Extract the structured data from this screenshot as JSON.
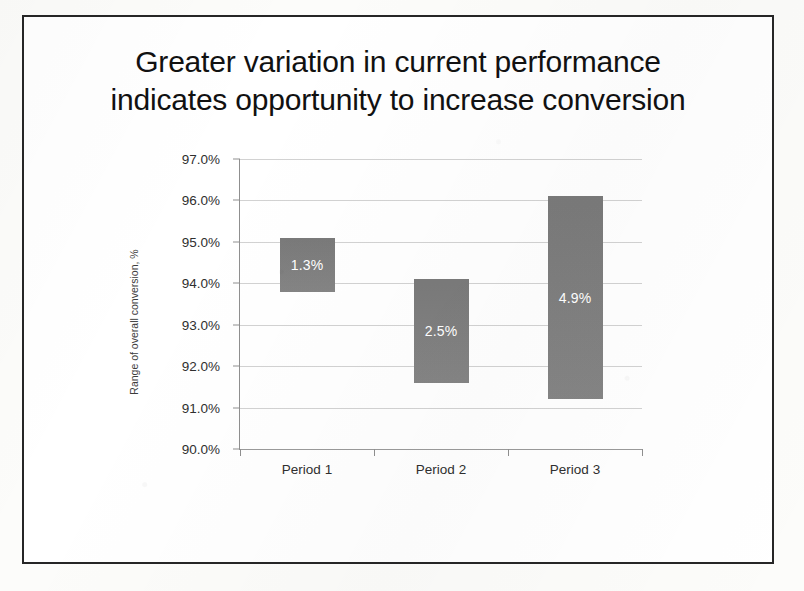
{
  "slide": {
    "title_line_1": "Greater variation in current performance",
    "title_line_2": "indicates opportunity to increase conversion"
  },
  "chart_data": {
    "type": "bar",
    "subtype": "floating-range-bar",
    "title": "Greater variation in current performance indicates opportunity to increase conversion",
    "xlabel": "",
    "ylabel": "Range of overall conversion, %",
    "categories": [
      "Period 1",
      "Period 2",
      "Period 3"
    ],
    "ylim": [
      90.0,
      97.0
    ],
    "ytick_labels": [
      "97.0%",
      "96.0%",
      "95.0%",
      "94.0%",
      "93.0%",
      "92.0%",
      "91.0%",
      "90.0%"
    ],
    "ytick_values": [
      97.0,
      96.0,
      95.0,
      94.0,
      93.0,
      92.0,
      91.0,
      90.0
    ],
    "grid": true,
    "legend": false,
    "bar_color": "#7f7f7f",
    "label_color": "#ffffff",
    "series": [
      {
        "name": "Range of overall conversion",
        "bars": [
          {
            "category": "Period 1",
            "low": 93.8,
            "high": 95.1,
            "range": 1.3,
            "label": "1.3%"
          },
          {
            "category": "Period 2",
            "low": 91.6,
            "high": 94.1,
            "range": 2.5,
            "label": "2.5%"
          },
          {
            "category": "Period 3",
            "low": 91.2,
            "high": 96.1,
            "range": 4.9,
            "label": "4.9%"
          }
        ]
      }
    ]
  }
}
